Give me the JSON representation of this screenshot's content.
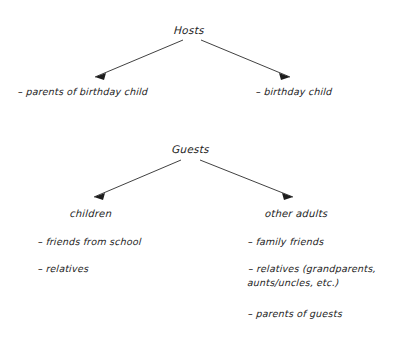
{
  "diagram": {
    "ink_color": "#242424",
    "background_color": "#ffffff",
    "sections": [
      {
        "root": "Hosts",
        "branches": [
          {
            "label": "",
            "items": [
              "– parents of birthday child"
            ]
          },
          {
            "label": "",
            "items": [
              "– birthday child"
            ]
          }
        ]
      },
      {
        "root": "Guests",
        "branches": [
          {
            "label": "children",
            "items": [
              "– friends from school",
              "– relatives"
            ]
          },
          {
            "label": "other adults",
            "items": [
              "– family friends",
              "– relatives (grandparents, aunts/uncles, etc.)",
              "– parents of guests"
            ]
          }
        ]
      }
    ]
  }
}
